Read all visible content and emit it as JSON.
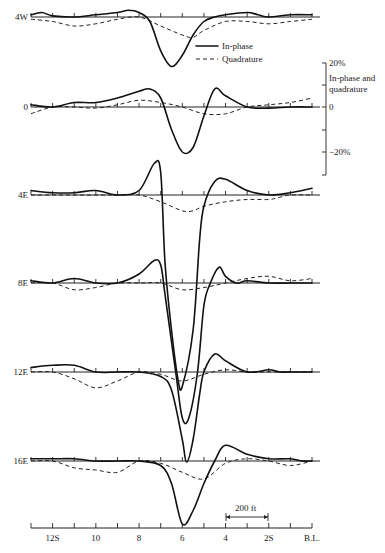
{
  "chart_data": {
    "type": "line",
    "title": "",
    "xlabel": "",
    "ylabel": "In-phase and quadrature",
    "legend": [
      {
        "label": "In-phase",
        "style": "solid"
      },
      {
        "label": "Quadrature",
        "style": "dashed"
      }
    ],
    "x_ticks": [
      "12S",
      "10",
      "8",
      "6",
      "4",
      "2S",
      "B.L."
    ],
    "x_tick_stations": [
      12,
      10,
      8,
      6,
      4,
      2,
      0
    ],
    "scale_bar": {
      "label": "200 ft",
      "from_station": 4,
      "to_station": 2
    },
    "y_scale": {
      "labels": [
        "20%",
        "0",
        "-20%"
      ],
      "values": [
        20,
        0,
        -20
      ],
      "title": "In-phase and quadrature"
    },
    "profile_offset_unit": "percent, 20% ≈ 45 px",
    "lines": [
      {
        "name": "4W",
        "baseline_y": 17,
        "in_phase": [
          [
            13,
            1
          ],
          [
            12.5,
            2
          ],
          [
            12,
            0.5
          ],
          [
            11,
            0
          ],
          [
            10,
            1
          ],
          [
            9,
            2
          ],
          [
            8.5,
            3
          ],
          [
            8,
            2
          ],
          [
            7.5,
            -2
          ],
          [
            7,
            -15
          ],
          [
            6.5,
            -22
          ],
          [
            6,
            -17
          ],
          [
            5.5,
            -8
          ],
          [
            5,
            -2
          ],
          [
            4.5,
            0
          ],
          [
            4,
            1
          ],
          [
            3,
            2
          ],
          [
            2.5,
            1
          ],
          [
            2,
            0
          ],
          [
            1,
            1
          ],
          [
            0,
            1
          ]
        ],
        "quadrature": [
          [
            13,
            -1
          ],
          [
            12,
            -2
          ],
          [
            11,
            -4
          ],
          [
            10,
            -3
          ],
          [
            9,
            -1
          ],
          [
            8,
            0
          ],
          [
            7,
            -4
          ],
          [
            6,
            -8
          ],
          [
            5.5,
            -9
          ],
          [
            5,
            -6
          ],
          [
            4,
            -2
          ],
          [
            3,
            -2
          ],
          [
            2,
            -3
          ],
          [
            1,
            -2
          ],
          [
            0,
            -1
          ]
        ]
      },
      {
        "name": "0",
        "baseline_y": 107,
        "in_phase": [
          [
            13,
            1
          ],
          [
            12,
            0
          ],
          [
            11,
            2
          ],
          [
            10,
            2
          ],
          [
            9,
            4
          ],
          [
            8,
            7
          ],
          [
            7.5,
            8
          ],
          [
            7,
            4
          ],
          [
            6.5,
            -10
          ],
          [
            6,
            -20
          ],
          [
            5.5,
            -18
          ],
          [
            5,
            -4
          ],
          [
            4.5,
            8
          ],
          [
            4,
            5
          ],
          [
            3,
            0
          ],
          [
            2,
            -0.5
          ],
          [
            1,
            0
          ],
          [
            0,
            0
          ]
        ],
        "quadrature": [
          [
            13,
            -3
          ],
          [
            12,
            0
          ],
          [
            11,
            0
          ],
          [
            10,
            -0.5
          ],
          [
            9,
            1
          ],
          [
            8,
            3
          ],
          [
            7,
            2
          ],
          [
            6,
            0
          ],
          [
            5,
            -3
          ],
          [
            4,
            -3
          ],
          [
            3,
            0
          ],
          [
            2,
            1
          ],
          [
            1,
            2
          ],
          [
            0,
            4
          ]
        ]
      },
      {
        "name": "4E",
        "baseline_y": 195,
        "in_phase": [
          [
            13,
            2
          ],
          [
            12,
            1
          ],
          [
            11,
            1
          ],
          [
            10,
            2
          ],
          [
            9,
            0
          ],
          [
            8,
            2
          ],
          [
            7.3,
            14
          ],
          [
            7,
            10
          ],
          [
            6.8,
            -30
          ],
          [
            6.5,
            -60
          ],
          [
            6.2,
            -82
          ],
          [
            6,
            -85
          ],
          [
            5.5,
            -60
          ],
          [
            5.2,
            -20
          ],
          [
            5,
            -5
          ],
          [
            4.5,
            6
          ],
          [
            4,
            7
          ],
          [
            3,
            2
          ],
          [
            2,
            0
          ],
          [
            1,
            1
          ],
          [
            0,
            3
          ]
        ],
        "quadrature": [
          [
            13,
            0
          ],
          [
            12,
            0
          ],
          [
            11,
            0
          ],
          [
            10,
            0
          ],
          [
            9,
            0
          ],
          [
            8,
            0
          ],
          [
            7,
            -3
          ],
          [
            6,
            -7
          ],
          [
            5.5,
            -7
          ],
          [
            5,
            -5
          ],
          [
            4,
            -3
          ],
          [
            3,
            -2
          ],
          [
            2,
            -2
          ],
          [
            1.5,
            -1
          ],
          [
            1,
            0
          ],
          [
            0,
            0
          ]
        ]
      },
      {
        "name": "8E",
        "baseline_y": 283,
        "in_phase": [
          [
            13,
            1
          ],
          [
            12,
            0
          ],
          [
            11,
            2
          ],
          [
            10,
            0
          ],
          [
            9,
            0
          ],
          [
            8,
            4
          ],
          [
            7.3,
            10
          ],
          [
            7,
            8
          ],
          [
            6.8,
            -5
          ],
          [
            6.3,
            -40
          ],
          [
            6,
            -60
          ],
          [
            5.7,
            -60
          ],
          [
            5.3,
            -40
          ],
          [
            5,
            -10
          ],
          [
            4.7,
            0
          ],
          [
            4.3,
            7
          ],
          [
            4,
            3
          ],
          [
            3.5,
            0
          ],
          [
            3,
            1
          ],
          [
            2,
            0
          ],
          [
            1,
            0
          ],
          [
            0,
            0
          ]
        ],
        "quadrature": [
          [
            13,
            0
          ],
          [
            12,
            0
          ],
          [
            11,
            -3
          ],
          [
            10,
            -2
          ],
          [
            9,
            0
          ],
          [
            8,
            0
          ],
          [
            7,
            0
          ],
          [
            6,
            -3
          ],
          [
            5,
            -2
          ],
          [
            4,
            0
          ],
          [
            3,
            2
          ],
          [
            2,
            3
          ],
          [
            1,
            1
          ],
          [
            0,
            2
          ]
        ]
      },
      {
        "name": "12E",
        "baseline_y": 372,
        "in_phase": [
          [
            13,
            2
          ],
          [
            12,
            3
          ],
          [
            11,
            3
          ],
          [
            10,
            0
          ],
          [
            9,
            0
          ],
          [
            8,
            0
          ],
          [
            7,
            -2
          ],
          [
            6.5,
            -8
          ],
          [
            6,
            -30
          ],
          [
            5.8,
            -40
          ],
          [
            5.5,
            -30
          ],
          [
            5.2,
            -10
          ],
          [
            5,
            0
          ],
          [
            4.5,
            8
          ],
          [
            4,
            5
          ],
          [
            3,
            0
          ],
          [
            2,
            1
          ],
          [
            1.5,
            0
          ],
          [
            1,
            0
          ],
          [
            0,
            0
          ]
        ],
        "quadrature": [
          [
            13,
            0
          ],
          [
            12,
            0
          ],
          [
            11,
            -3
          ],
          [
            10,
            -7
          ],
          [
            9,
            -4
          ],
          [
            8,
            0
          ],
          [
            7,
            -1
          ],
          [
            6,
            -4
          ],
          [
            5,
            -1
          ],
          [
            4,
            1
          ],
          [
            3,
            0
          ],
          [
            2,
            0
          ],
          [
            1,
            0
          ],
          [
            0,
            0
          ]
        ]
      },
      {
        "name": "16E",
        "baseline_y": 461,
        "in_phase": [
          [
            13,
            1
          ],
          [
            12,
            1
          ],
          [
            11,
            1
          ],
          [
            10,
            0
          ],
          [
            9,
            0
          ],
          [
            8,
            0
          ],
          [
            7,
            -2
          ],
          [
            6.5,
            -10
          ],
          [
            6,
            -28
          ],
          [
            5.5,
            -22
          ],
          [
            5,
            -10
          ],
          [
            4.5,
            0
          ],
          [
            4,
            7
          ],
          [
            3,
            3
          ],
          [
            2,
            1
          ],
          [
            1,
            1
          ],
          [
            0.5,
            0
          ],
          [
            0,
            0
          ]
        ],
        "quadrature": [
          [
            13,
            0
          ],
          [
            12,
            0
          ],
          [
            11,
            -3
          ],
          [
            10,
            -4
          ],
          [
            9,
            -5
          ],
          [
            8,
            0
          ],
          [
            7,
            -1
          ],
          [
            6,
            -5
          ],
          [
            5,
            -8
          ],
          [
            4,
            -1
          ],
          [
            3,
            1
          ],
          [
            2,
            0
          ],
          [
            1,
            -2
          ],
          [
            0,
            0
          ]
        ]
      }
    ],
    "axis_range_stations": [
      13,
      0
    ]
  },
  "labels": {
    "legend_inphase": "In-phase",
    "legend_quadrature": "Quadrature",
    "scale_20": "20%",
    "scale_title_1": "In-phase and",
    "scale_title_2": "quadrature",
    "scale_0": "0",
    "scale_m20": "−20%",
    "scale_bar": "200 ft"
  }
}
